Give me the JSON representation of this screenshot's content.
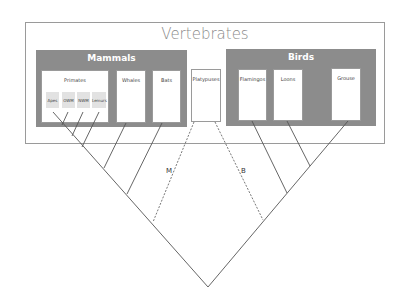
{
  "diagram": {
    "title": "Vertebrates",
    "groups": [
      {
        "name": "Mammals",
        "leaves": [
          {
            "name": "Primates",
            "subgroups": [
              "Apes",
              "OWM",
              "NWM",
              "Lemurs"
            ]
          },
          {
            "name": "Whales"
          },
          {
            "name": "Bats"
          }
        ]
      },
      {
        "name": "Birds",
        "leaves": [
          {
            "name": "Flamingos"
          },
          {
            "name": "Loons"
          },
          {
            "name": "Grouse"
          }
        ]
      }
    ],
    "standalone_leaf": "Platypuses",
    "branch_labels": {
      "mammal_branch": "M",
      "bird_branch": "B"
    },
    "colors": {
      "group_fill": "#8c8c8c",
      "subgroup_fill": "#e2e2e2",
      "line": "#555555",
      "border": "#9a9a9a"
    }
  }
}
